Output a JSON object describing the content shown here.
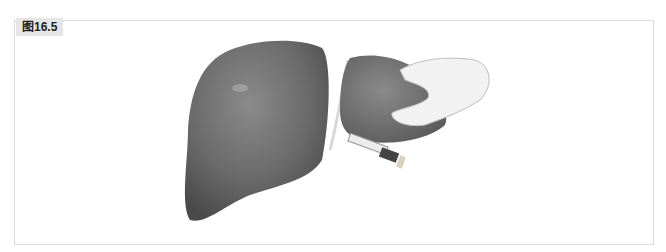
{
  "figure": {
    "label": "图16.5",
    "illustration": "liver-resection-hand-stapler",
    "colors": {
      "liver_dark": "#5a5a5a",
      "liver_mid": "#7a7a7a",
      "liver_light": "#9a9a9a",
      "hand": "#f2f2f2",
      "border": "#dcdcdc",
      "label_bg": "#e6e6e6"
    }
  }
}
